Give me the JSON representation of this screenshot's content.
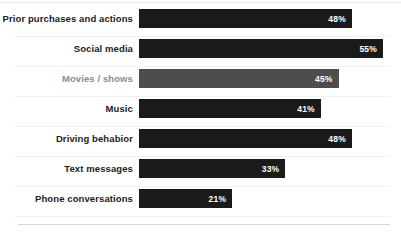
{
  "chart_data": {
    "type": "bar",
    "orientation": "horizontal",
    "title": "",
    "subtitle": "",
    "xlabel": "",
    "ylabel": "",
    "xlim": [
      0,
      55
    ],
    "grid": false,
    "legend": null,
    "value_suffix": "%",
    "categories": [
      "Prior purchases and actions",
      "Social media",
      "Movies / shows",
      "Music",
      "Driving behabior",
      "Text messages",
      "Phone conversations"
    ],
    "values": [
      48,
      55,
      45,
      41,
      48,
      33,
      21
    ],
    "value_labels": [
      "48%",
      "55%",
      "45%",
      "41%",
      "48%",
      "33%",
      "21%"
    ],
    "series": [
      {
        "name": "",
        "values": [
          48,
          55,
          45,
          41,
          48,
          33,
          21
        ]
      }
    ],
    "bars": [
      {
        "category": "Prior purchases and actions",
        "value": 48,
        "label": "48%",
        "highlighted": false,
        "bar_color": "#1a1a1a",
        "label_color": "#1c1c1c"
      },
      {
        "category": "Social media",
        "value": 55,
        "label": "55%",
        "highlighted": false,
        "bar_color": "#1a1a1a",
        "label_color": "#1c1c1c"
      },
      {
        "category": "Movies / shows",
        "value": 45,
        "label": "45%",
        "highlighted": true,
        "bar_color": "#4d4d4d",
        "label_color": "#8c8c8c"
      },
      {
        "category": "Music",
        "value": 41,
        "label": "41%",
        "highlighted": false,
        "bar_color": "#1a1a1a",
        "label_color": "#1c1c1c"
      },
      {
        "category": "Driving behabior",
        "value": 48,
        "label": "48%",
        "highlighted": false,
        "bar_color": "#1a1a1a",
        "label_color": "#1c1c1c"
      },
      {
        "category": "Text messages",
        "value": 33,
        "label": "33%",
        "highlighted": false,
        "bar_color": "#1a1a1a",
        "label_color": "#1c1c1c"
      },
      {
        "category": "Phone conversations",
        "value": 21,
        "label": "21%",
        "highlighted": false,
        "bar_color": "#1a1a1a",
        "label_color": "#1c1c1c"
      }
    ],
    "colors": {
      "bar_default": "#1a1a1a",
      "bar_muted": "#4d4d4d",
      "value_text": "#ffffff",
      "label_default": "#1c1c1c",
      "label_muted": "#8c8c8c",
      "background": "#ffffff",
      "separator": "#f2f2f2",
      "border": "#d7d7d7"
    }
  }
}
